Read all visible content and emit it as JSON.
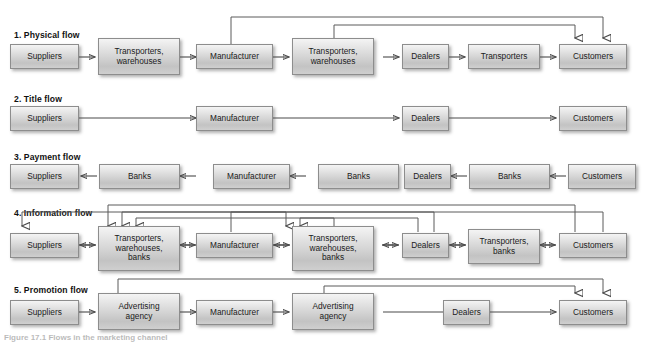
{
  "figure": {
    "caption": "Figure 17.1  Flows in the marketing channel"
  },
  "rows": [
    {
      "id": "physical-flow",
      "title": "1. Physical flow",
      "nodes": [
        "Suppliers",
        "Transporters,\nwarehouses",
        "Manufacturer",
        "Transporters,\nwarehouses",
        "Dealers",
        "Transporters",
        "Customers"
      ],
      "direction": "forward",
      "overhead_links": 2
    },
    {
      "id": "title-flow",
      "title": "2. Title flow",
      "nodes": [
        "Suppliers",
        "Manufacturer",
        "Dealers",
        "Customers"
      ],
      "direction": "forward",
      "overhead_links": 0
    },
    {
      "id": "payment-flow",
      "title": "3. Payment flow",
      "nodes": [
        "Suppliers",
        "Banks",
        "Manufacturer",
        "Banks",
        "Dealers",
        "Banks",
        "Customers"
      ],
      "direction": "backward",
      "overhead_links": 0
    },
    {
      "id": "information-flow",
      "title": "4. Information flow",
      "nodes": [
        "Suppliers",
        "Transporters,\nwarehouses,\nbanks",
        "Manufacturer",
        "Transporters,\nwarehouses,\nbanks",
        "Dealers",
        "Transporters,\nbanks",
        "Customers"
      ],
      "direction": "bidirectional",
      "overhead_links": 6
    },
    {
      "id": "promotion-flow",
      "title": "5. Promotion flow",
      "nodes": [
        "Suppliers",
        "Advertising\nagency",
        "Manufacturer",
        "Advertising\nagency",
        "Dealers",
        "Customers"
      ],
      "direction": "forward",
      "overhead_links": 2
    }
  ],
  "colors": {
    "box_border": "#8d8d8d",
    "box_fill_top": "#f4f4f4",
    "box_fill_bottom": "#c3c3c3",
    "wire": "#4a4a4a",
    "text": "#1b1b1b"
  }
}
